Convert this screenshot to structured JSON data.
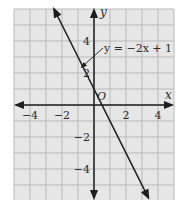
{
  "chart_data": {
    "type": "line",
    "title": "",
    "xlabel": "x",
    "ylabel": "y",
    "origin_label": "O",
    "xlim": [
      -5,
      5
    ],
    "ylim": [
      -6,
      6
    ],
    "grid": true,
    "x_ticks": [
      -4,
      -2,
      2,
      4
    ],
    "x_tick_labels": [
      "−4",
      "−2",
      "2",
      "4"
    ],
    "y_ticks": [
      4,
      2,
      -2,
      -4
    ],
    "y_tick_labels": [
      "4",
      "2",
      "−2",
      "−4"
    ],
    "series": [
      {
        "name": "y = −2x + 1",
        "equation": "y = -2x + 1",
        "slope": -2,
        "intercept": 1,
        "x": [
          -2.5,
          3.4
        ],
        "y": [
          6,
          -5.8
        ],
        "arrows": "both"
      }
    ],
    "annotations": [
      {
        "text": "y = −2x + 1",
        "points_to": [
          -0.9,
          2.8
        ]
      }
    ],
    "colors": {
      "grid_background": "#e6e6e6",
      "grid_lines": "#b9b9b9",
      "axes": "#1e1e1e",
      "line": "#1e1e1e"
    }
  }
}
